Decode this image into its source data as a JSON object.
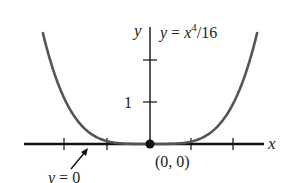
{
  "chart_data": {
    "type": "line",
    "title": "",
    "function": "y = x^4/16",
    "series": [
      {
        "name": "y = x^4/16",
        "x": [
          -2.55,
          -2.5,
          -2,
          -1.5,
          -1,
          -0.5,
          0,
          0.5,
          1,
          1.5,
          2,
          2.5,
          2.55
        ],
        "y": [
          2.64,
          2.44,
          1.0,
          0.316,
          0.0625,
          0.0039,
          0,
          0.0039,
          0.0625,
          0.316,
          1.0,
          2.44,
          2.64
        ]
      }
    ],
    "xlabel": "x",
    "ylabel": "y",
    "xlim": [
      -3.0,
      2.75
    ],
    "ylim": [
      -0.9,
      2.75
    ],
    "x_ticks": [
      -2,
      -1,
      1,
      2
    ],
    "y_ticks": [
      1,
      2
    ],
    "y_tick_labels": [
      "1",
      ""
    ],
    "annotations": [
      {
        "text": "y = x⁴/16",
        "role": "curve-label"
      },
      {
        "text": "y = 0",
        "role": "asymptote-label",
        "points_to": "x-axis"
      },
      {
        "text": "(0, 0)",
        "role": "point-label",
        "point": [
          0,
          0
        ]
      }
    ],
    "grid": false,
    "legend": "none"
  },
  "labels": {
    "y_axis": "y",
    "x_axis": "x",
    "function_prefix": "y = x",
    "function_exp": "4",
    "function_suffix": "/16",
    "tick_one": "1",
    "y_zero": "y = 0",
    "origin": "(0, 0)"
  },
  "colors": {
    "curve": "#555555",
    "axes": "#111111",
    "text": "#222222"
  }
}
